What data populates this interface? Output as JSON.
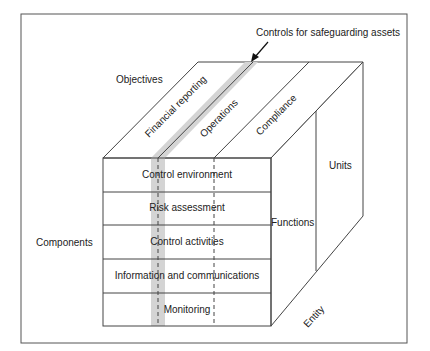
{
  "diagram": {
    "title_callout": "Controls for safeguarding assets",
    "axes": {
      "objectives_label": "Objectives",
      "components_label": "Components",
      "units_label": "Units",
      "functions_label": "Functions",
      "entity_label": "Entity"
    },
    "objectives": [
      "Financial reporting",
      "Operations",
      "Compliance"
    ],
    "components": [
      "Control environment",
      "Risk assessment",
      "Control activities",
      "Information and communications",
      "Monitoring"
    ],
    "colors": {
      "line": "#444444",
      "highlight_band": "#d4d4d4",
      "frame": "#555555"
    }
  }
}
